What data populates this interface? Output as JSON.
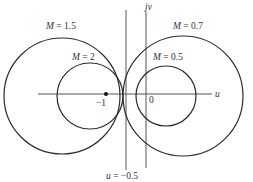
{
  "diagram": {
    "type": "constant-M circles (Nyquist plane)",
    "axes": {
      "horizontal_label": "u",
      "vertical_label": "jv",
      "tick_minus_one": "−1",
      "tick_zero": "0"
    },
    "circles": [
      {
        "label_var": "M",
        "label_eq": " = 1.5",
        "cx": 62,
        "cy": 96,
        "r": 58
      },
      {
        "label_var": "M",
        "label_eq": " = 2",
        "cx": 90,
        "cy": 96,
        "r": 33
      },
      {
        "label_var": "M",
        "label_eq": " = 0.7",
        "cx": 183,
        "cy": 96,
        "r": 60
      },
      {
        "label_var": "M",
        "label_eq": " = 0.5",
        "cx": 166,
        "cy": 96,
        "r": 30
      }
    ],
    "vertical_line": {
      "label_var": "u",
      "label_eq": " = −0.5"
    },
    "stroke_color": "#2b2b2b",
    "axis_color": "#555555"
  }
}
